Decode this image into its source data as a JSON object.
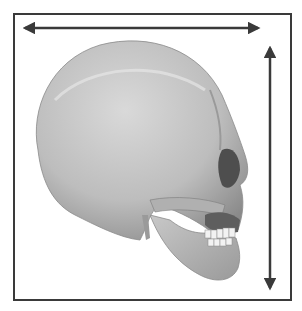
{
  "figure": {
    "colors": {
      "frame": "#3a3a3a",
      "arrow": "#3a3a3a",
      "bone_light": "#d6d6d6",
      "bone_mid": "#a9a9a9",
      "bone_dark": "#5e5e5e",
      "background": "#ffffff"
    },
    "horizontal_arrow": {
      "label": "skull length"
    },
    "vertical_arrow": {
      "label": "skull height"
    }
  }
}
